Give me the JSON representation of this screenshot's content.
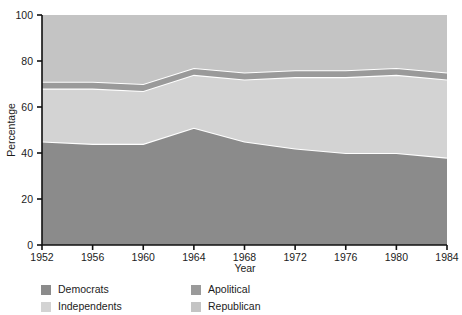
{
  "chart_data": {
    "type": "area",
    "title": "",
    "subtitle": "",
    "xlabel": "Year",
    "ylabel": "Percentage",
    "x": [
      1952,
      1956,
      1960,
      1964,
      1968,
      1972,
      1976,
      1980,
      1984
    ],
    "xlim": [
      1952,
      1984
    ],
    "ylim": [
      0,
      100
    ],
    "xticks": [
      "1952",
      "1956",
      "1960",
      "1964",
      "1968",
      "1972",
      "1976",
      "1980",
      "1984"
    ],
    "yticks": [
      "0",
      "20",
      "40",
      "60",
      "80",
      "100"
    ],
    "grid": false,
    "stacked": true,
    "legend_position": "bottom",
    "series": [
      {
        "name": "Democrats",
        "color": "#8b8b8b",
        "values": [
          45,
          44,
          44,
          51,
          45,
          42,
          40,
          40,
          38
        ]
      },
      {
        "name": "Independents",
        "color": "#d3d3d3",
        "values": [
          23,
          24,
          23,
          23,
          27,
          31,
          33,
          34,
          34
        ]
      },
      {
        "name": "Apolitical",
        "color": "#9a9a9a",
        "values": [
          3,
          3,
          3,
          3,
          3,
          3,
          3,
          3,
          3
        ]
      },
      {
        "name": "Republican",
        "color": "#c4c4c4",
        "values": [
          29,
          29,
          30,
          23,
          25,
          24,
          24,
          23,
          25
        ]
      }
    ]
  },
  "axes": {
    "ylabel": "Percentage",
    "xlabel": "Year"
  },
  "legend": {
    "items": [
      {
        "label": "Democrats",
        "color": "#8b8b8b"
      },
      {
        "label": "Independents",
        "color": "#d3d3d3"
      },
      {
        "label": "Apolitical",
        "color": "#9a9a9a"
      },
      {
        "label": "Republican",
        "color": "#c4c4c4"
      }
    ]
  }
}
